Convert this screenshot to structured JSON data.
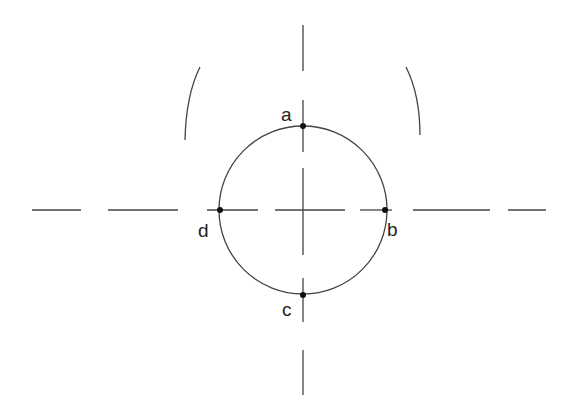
{
  "diagram": {
    "type": "circle-with-centerlines",
    "colors": {
      "stroke": "#444444",
      "point": "#111111",
      "text": "#222222",
      "background": "#ffffff"
    },
    "circle": {
      "cx": 303,
      "cy": 210,
      "r": 84
    },
    "points": [
      {
        "label": "a",
        "x": 303,
        "y": 126,
        "label_x": 287,
        "label_y": 120
      },
      {
        "label": "b",
        "x": 385,
        "y": 210,
        "label_x": 388,
        "label_y": 236
      },
      {
        "label": "c",
        "x": 303,
        "y": 295,
        "label_x": 282,
        "label_y": 318
      },
      {
        "label": "d",
        "x": 220,
        "y": 210,
        "label_x": 198,
        "label_y": 238
      }
    ],
    "centerlines": {
      "horizontal_y": 210,
      "vertical_x": 303
    }
  }
}
